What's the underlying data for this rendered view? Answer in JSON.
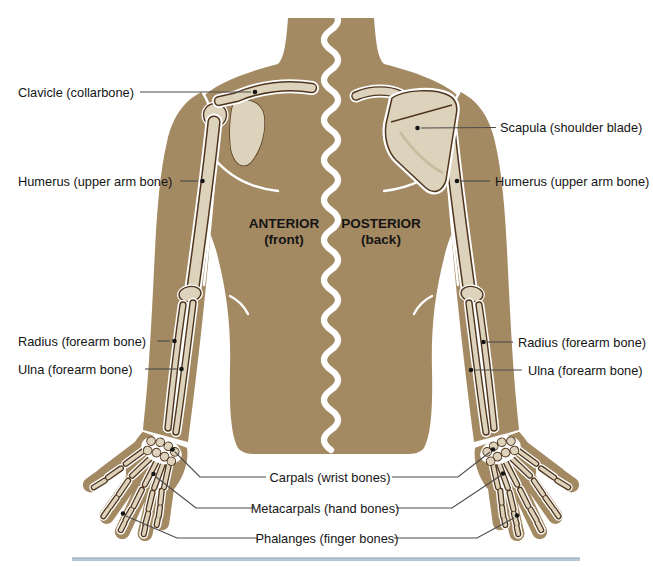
{
  "diagram": {
    "left_labels": {
      "clavicle": "Clavicle (collarbone)",
      "humerus": "Humerus (upper arm bone)",
      "radius": "Radius (forearm bone)",
      "ulna": "Ulna (forearm bone)"
    },
    "right_labels": {
      "scapula": "Scapula (shoulder blade)",
      "humerus": "Humerus (upper arm bone)",
      "radius": "Radius (forearm bone)",
      "ulna": "Ulna (forearm bone)"
    },
    "center_labels": {
      "anterior_title": "ANTERIOR",
      "anterior_sub": "(front)",
      "posterior_title": "POSTERIOR",
      "posterior_sub": "(back)"
    },
    "hand_labels": {
      "carpals": "Carpals (wrist bones)",
      "metacarpals": "Metacarpals (hand bones)",
      "phalanges": "Phalanges (finger bones)"
    },
    "colors": {
      "skin": "#a48a63",
      "bone": "#ddd3bc",
      "bone_outline": "#4f351d",
      "bone_halo": "#ffffff",
      "leader_line": "#4a4a4a",
      "text": "#141414",
      "divider": "#b9c6d4",
      "background": "#ffffff"
    }
  }
}
